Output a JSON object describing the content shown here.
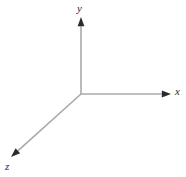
{
  "figure": {
    "background_color": "#ffffff",
    "width": 186,
    "height": 177,
    "axis_line_color": "#a9a9a9",
    "arrowhead_color": "#2b2b2b",
    "label_color": "#2b2b2b",
    "origin": {
      "x": 81,
      "y": 94
    },
    "axes": [
      {
        "id": "y",
        "label": "y",
        "direction": "up",
        "from": {
          "x": 81,
          "y": 94
        },
        "to": {
          "x": 81,
          "y": 17
        }
      },
      {
        "id": "x",
        "label": "x",
        "direction": "right",
        "from": {
          "x": 81,
          "y": 94
        },
        "to": {
          "x": 171,
          "y": 94
        }
      },
      {
        "id": "z",
        "label": "z",
        "direction": "down-left",
        "from": {
          "x": 81,
          "y": 94
        },
        "to": {
          "x": 11,
          "y": 157
        }
      }
    ]
  }
}
